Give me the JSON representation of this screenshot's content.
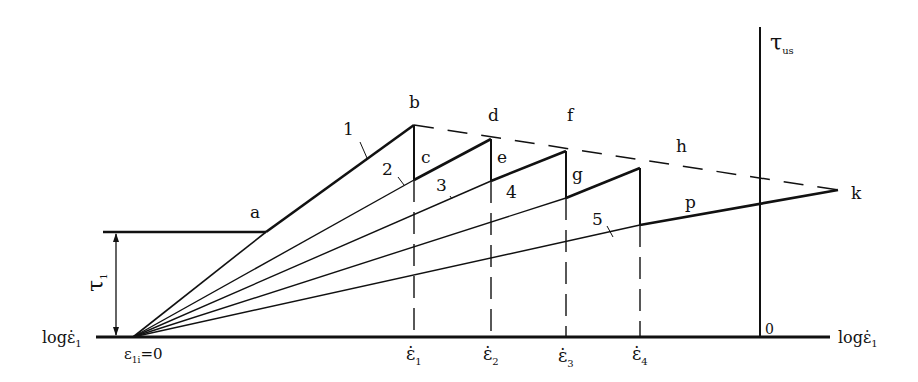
{
  "diagram": {
    "type": "stress-strain-rate schematic",
    "axes": {
      "x_label_left": "logε̇",
      "x_label_left_sub": "1",
      "x_label_right": "logε̇",
      "x_label_right_sub": "1",
      "y_label": "τ",
      "y_label_sub": "us",
      "origin_label": "0",
      "start_label": "ε",
      "start_label_sub": "1i",
      "start_label_suffix": "=0",
      "tau_label": "τ",
      "tau_label_sub": "1"
    },
    "ticks": [
      {
        "label": "ε̇",
        "sub": "1"
      },
      {
        "label": "ε̇",
        "sub": "2"
      },
      {
        "label": "ε̇",
        "sub": "3"
      },
      {
        "label": "ε̇",
        "sub": "4"
      }
    ],
    "points": {
      "a": "a",
      "b": "b",
      "c": "c",
      "d": "d",
      "e": "e",
      "f": "f",
      "g": "g",
      "h": "h",
      "p": "p",
      "k": "k"
    },
    "curves": [
      "1",
      "2",
      "3",
      "4",
      "5"
    ]
  }
}
